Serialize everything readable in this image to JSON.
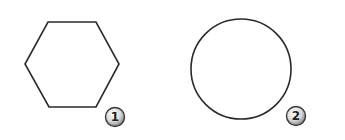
{
  "diagram": {
    "background": "#ffffff",
    "stroke_color": "#2a2a2a",
    "shapes": [
      {
        "id": "shape-1",
        "type": "hexagon",
        "label": "1",
        "points": "48,22 96,22 119,64 96,107 49,107 25,64"
      },
      {
        "id": "shape-2",
        "type": "circle",
        "label": "2",
        "cx": 241,
        "cy": 69,
        "r": 50
      }
    ],
    "badges": [
      {
        "label": "1",
        "cx": 115,
        "cy": 117
      },
      {
        "label": "2",
        "cx": 296,
        "cy": 116
      }
    ]
  }
}
